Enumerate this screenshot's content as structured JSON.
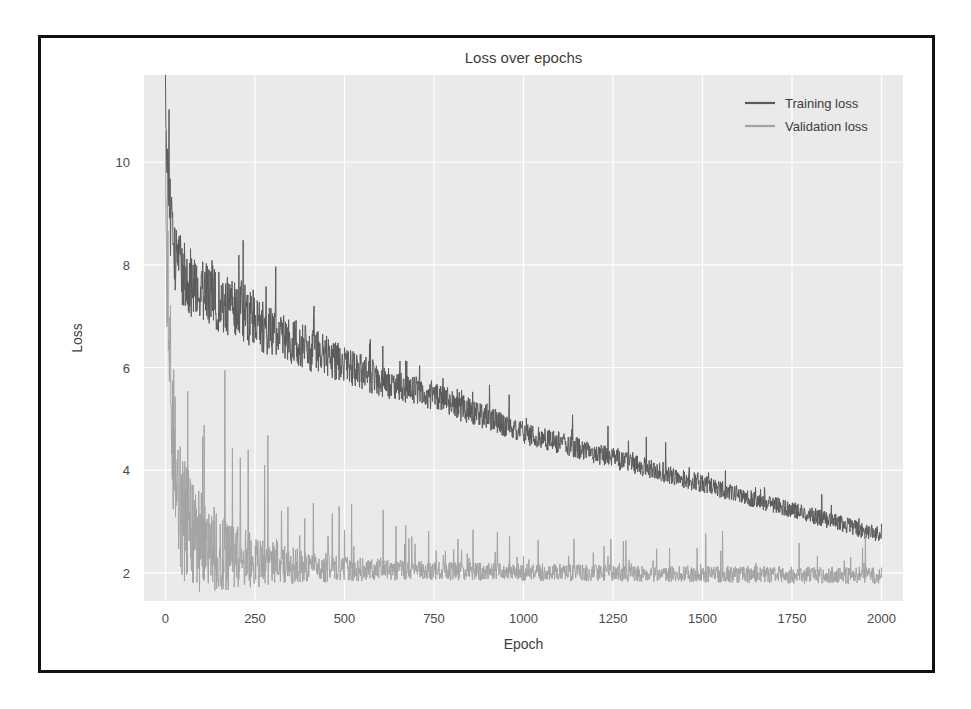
{
  "figure": {
    "title": "Loss over epochs",
    "frame_color": "#111111",
    "plot_background": "#eaeaea",
    "grid_color": "#ffffff"
  },
  "chart_data": {
    "type": "line",
    "title": "Loss over epochs",
    "xlabel": "Epoch",
    "ylabel": "Loss",
    "xlim": [
      -60,
      2060
    ],
    "ylim": [
      1.45,
      11.7
    ],
    "grid": true,
    "legend_position": "upper right",
    "xticks": [
      0,
      250,
      500,
      750,
      1000,
      1250,
      1500,
      1750,
      2000
    ],
    "xtick_labels": [
      "0",
      "250",
      "500",
      "750",
      "1000",
      "1250",
      "1500",
      "1750",
      "2000"
    ],
    "yticks": [
      2,
      4,
      6,
      8,
      10
    ],
    "ytick_labels": [
      "2",
      "4",
      "6",
      "8",
      "10"
    ],
    "series": [
      {
        "name": "Training loss",
        "color": "#5a5a5a",
        "noise_amplitude": 0.42,
        "x": [
          0,
          10,
          20,
          30,
          40,
          50,
          60,
          80,
          100,
          125,
          150,
          175,
          200,
          250,
          300,
          350,
          400,
          450,
          500,
          550,
          600,
          650,
          700,
          750,
          800,
          850,
          900,
          950,
          1000,
          1050,
          1100,
          1150,
          1200,
          1250,
          1300,
          1350,
          1400,
          1450,
          1500,
          1550,
          1600,
          1650,
          1700,
          1750,
          1800,
          1850,
          1900,
          1950,
          2000
        ],
        "values": [
          11.3,
          9.0,
          8.4,
          8.0,
          7.8,
          7.7,
          7.6,
          7.5,
          7.4,
          7.3,
          7.2,
          7.1,
          7.0,
          6.8,
          6.6,
          6.45,
          6.3,
          6.15,
          6.0,
          5.85,
          5.7,
          5.6,
          5.5,
          5.4,
          5.25,
          5.1,
          5.0,
          4.85,
          4.7,
          4.6,
          4.5,
          4.4,
          4.3,
          4.2,
          4.1,
          4.0,
          3.9,
          3.8,
          3.7,
          3.6,
          3.5,
          3.4,
          3.3,
          3.2,
          3.1,
          3.0,
          2.9,
          2.8,
          2.7
        ]
      },
      {
        "name": "Validation loss",
        "color": "#a3a3a3",
        "noise_amplitude": 0.55,
        "x": [
          0,
          10,
          20,
          30,
          40,
          50,
          60,
          80,
          100,
          125,
          150,
          175,
          200,
          250,
          300,
          350,
          400,
          450,
          500,
          550,
          600,
          650,
          700,
          750,
          800,
          850,
          900,
          950,
          1000,
          1050,
          1100,
          1150,
          1200,
          1250,
          1300,
          1350,
          1400,
          1450,
          1500,
          1550,
          1600,
          1650,
          1700,
          1750,
          1800,
          1850,
          1900,
          1950,
          2000
        ],
        "values": [
          9.1,
          6.2,
          4.6,
          3.7,
          3.2,
          2.9,
          2.75,
          2.55,
          2.45,
          2.35,
          2.3,
          2.25,
          2.2,
          2.15,
          2.1,
          2.08,
          2.06,
          2.05,
          2.04,
          2.03,
          2.02,
          2.02,
          2.01,
          2.0,
          2.0,
          2.0,
          1.99,
          1.99,
          1.98,
          1.98,
          1.98,
          1.97,
          1.97,
          1.97,
          1.96,
          1.96,
          1.96,
          1.95,
          1.95,
          1.95,
          1.94,
          1.94,
          1.94,
          1.93,
          1.93,
          1.93,
          1.92,
          1.92,
          1.92
        ]
      }
    ]
  },
  "legend": {
    "items": [
      {
        "label": "Training loss",
        "color": "#5a5a5a"
      },
      {
        "label": "Validation loss",
        "color": "#a3a3a3"
      }
    ]
  }
}
